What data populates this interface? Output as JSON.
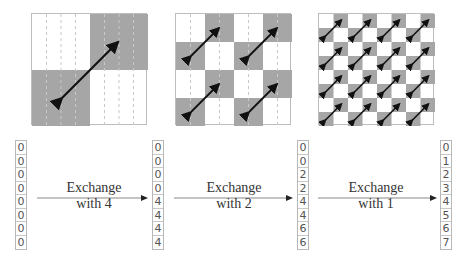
{
  "grids": [
    {
      "id": "grid-exchange-4",
      "blocks": 2,
      "dashed_columns": 8,
      "arrows": 1
    },
    {
      "id": "grid-exchange-2",
      "blocks": 4,
      "dashed_columns": 8,
      "arrows": 4
    },
    {
      "id": "grid-exchange-1",
      "blocks": 8,
      "dashed_columns": 0,
      "arrows": 16
    }
  ],
  "colors": {
    "shade": "#a6a6a6",
    "grid_border": "#bdbdbd",
    "arrow": "#111111",
    "dash": "#c8c8c8"
  },
  "columns": [
    {
      "values": [
        "0",
        "0",
        "0",
        "0",
        "0",
        "0",
        "0",
        "0"
      ]
    },
    {
      "values": [
        "0",
        "0",
        "0",
        "0",
        "4",
        "4",
        "4",
        "4"
      ]
    },
    {
      "values": [
        "0",
        "0",
        "2",
        "2",
        "4",
        "4",
        "6",
        "6"
      ]
    },
    {
      "values": [
        "0",
        "1",
        "2",
        "3",
        "4",
        "5",
        "6",
        "7"
      ]
    }
  ],
  "steps": [
    {
      "line1": "Exchange",
      "line2": "with 4"
    },
    {
      "line1": "Exchange",
      "line2": "with 2"
    },
    {
      "line1": "Exchange",
      "line2": "with 1"
    }
  ]
}
